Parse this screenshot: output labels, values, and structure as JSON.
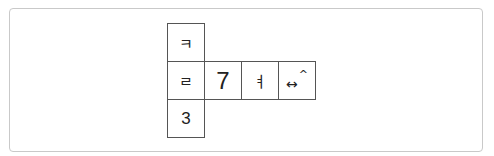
{
  "diagram": {
    "type": "cube-net",
    "cells": {
      "top": "ㅋ",
      "middle": [
        "ㄹ",
        "7",
        "ㅕ",
        "↔"
      ],
      "middle_suffix": "^",
      "bottom": "3"
    }
  }
}
